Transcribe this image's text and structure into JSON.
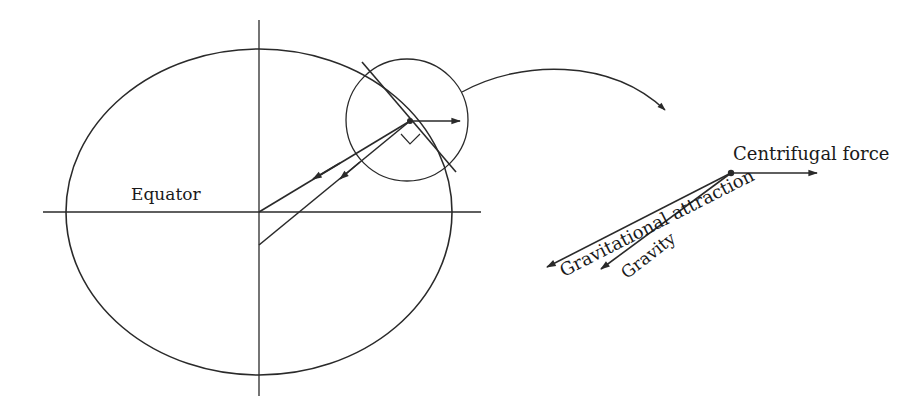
{
  "diagram": {
    "title": "",
    "labels": {
      "equator": "Equator",
      "centrifugal_force": "Centrifugal force",
      "gravitational_attraction": "Gravitational attraction",
      "gravity": "Gravity"
    },
    "colors": {
      "stroke": "#2a2a2a",
      "background": "#ffffff"
    },
    "elements": [
      "ellipse-earth",
      "polar-axis",
      "equatorial-axis",
      "magnifier-circle",
      "tangent-line",
      "right-angle-marker",
      "centrifugal-arrow",
      "gravitational-attraction-arrow",
      "gravity-arrow",
      "connector-curve-arrow",
      "force-diagram"
    ]
  }
}
